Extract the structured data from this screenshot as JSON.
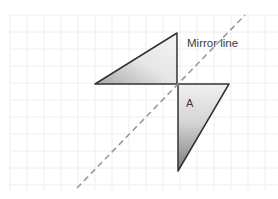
{
  "diagram": {
    "mirror_label": "Mirror line",
    "shape_label": "A",
    "colors": {
      "background": "#ffffff",
      "grid": "#eeeeee",
      "outline": "#333333",
      "mirror_line": "#9a9a9a",
      "fill_light": "#f2f2f2",
      "fill_dark": "#8a8a8a"
    },
    "grid": {
      "x0": 10,
      "y0": 15,
      "spacing": 17
    },
    "triangles": {
      "original": [
        [
          178,
          84
        ],
        [
          229,
          84
        ],
        [
          178,
          171
        ]
      ],
      "reflected": [
        [
          177,
          33
        ],
        [
          95,
          84
        ],
        [
          177,
          84
        ]
      ]
    },
    "mirror_line_points": [
      [
        77,
        188
      ],
      [
        245,
        15
      ]
    ]
  }
}
